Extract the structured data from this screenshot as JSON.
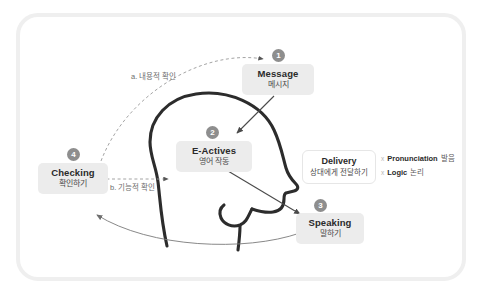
{
  "diagram": {
    "frame_color": "#efefef",
    "accent_gray": "#8e8e8e",
    "chip_bg": "#ececec"
  },
  "nodes": [
    {
      "id": "message",
      "number": "1",
      "en": "Message",
      "ko": "메시지"
    },
    {
      "id": "eactives",
      "number": "2",
      "en": "E-Actives",
      "ko": "영어 작동"
    },
    {
      "id": "speaking",
      "number": "3",
      "en": "Speaking",
      "ko": "말하기"
    },
    {
      "id": "checking",
      "number": "4",
      "en": "Checking",
      "ko": "확인하기"
    }
  ],
  "delivery": {
    "en": "Delivery",
    "ko": "상대에게 전달하기",
    "bullet_mark": "x",
    "items": [
      {
        "en": "Pronunciation",
        "ko": "발음"
      },
      {
        "en": "Logic",
        "ko": "논리"
      }
    ]
  },
  "annotations": [
    {
      "id": "a",
      "text": "a. 내용적 확인"
    },
    {
      "id": "b",
      "text": "b. 기능적 확인"
    }
  ]
}
